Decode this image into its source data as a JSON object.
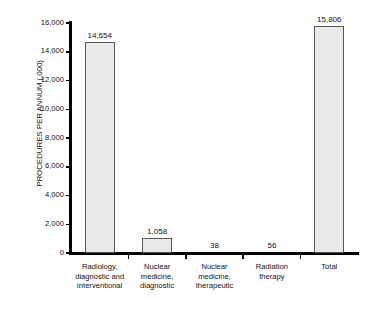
{
  "chart_data": {
    "type": "bar",
    "title": "",
    "xlabel": "",
    "ylabel": "PROCEDURES PER ANNUM (,000)",
    "ylim": [
      0,
      16000
    ],
    "ytick_values": [
      0,
      2000,
      4000,
      6000,
      8000,
      10000,
      12000,
      14000,
      16000
    ],
    "ytick_labels": [
      "0",
      "2,000",
      "4,000",
      "6,000",
      "8,000",
      "10,000",
      "12,000",
      "14,000",
      "16,000"
    ],
    "grid": false,
    "legend": false,
    "categories": [
      "Radiology,\ndiagnostic and\ninterventional",
      "Nuclear\nmedicine,\ndiagnostic",
      "Nuclear\nmedicine,\ntherapeutic",
      "Radiation\ntherapy",
      "Total"
    ],
    "category_lines": [
      [
        "Radiology,",
        "diagnostic and",
        "interventional"
      ],
      [
        "Nuclear",
        "medicine,",
        "diagnostic"
      ],
      [
        "Nuclear",
        "medicine,",
        "therapeutic"
      ],
      [
        "Radiation",
        "therapy"
      ],
      [
        "Total"
      ]
    ],
    "values": [
      14654,
      1058,
      38,
      56,
      15806
    ],
    "value_labels": [
      "14,654",
      "1,058",
      "38",
      "56",
      "15,806"
    ],
    "bar_fill_color": "#e9e9e9",
    "bar_border_color": "#585858",
    "axis_color": "#000000",
    "background_color": "#ffffff"
  }
}
